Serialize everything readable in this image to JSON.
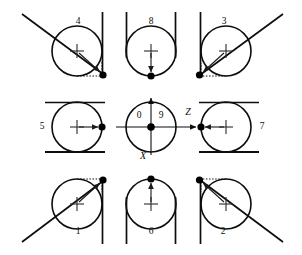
{
  "figure": {
    "type": "technical-diagram",
    "layout": "3x3-grid",
    "background_color": "#ffffff",
    "line_color": "#0d0d0d",
    "dot_color": "#000000"
  },
  "axes": {
    "vertical_label": "X",
    "horizontal_label": "Z",
    "quadrant_left_label": "0",
    "quadrant_right_label": "9",
    "vertical_direction": "up-arrow",
    "horizontal_direction": "right-arrow"
  },
  "cells": [
    {
      "id": "cell-4",
      "label": "4",
      "label_x": 78,
      "label_y": 22,
      "cx": 77,
      "cy": 51,
      "r": 25,
      "contact_dot_x": 104,
      "contact_dot_y": 74,
      "tangents": "diagonal-upper-left + vertical-right",
      "arrow": "center-to-lower-right"
    },
    {
      "id": "cell-8",
      "label": "8",
      "label_x": 151,
      "label_y": 22,
      "cx": 151,
      "cy": 51,
      "r": 25,
      "contact_dot_x": 151,
      "contact_dot_y": 76,
      "tangents": "vertical-left + vertical-right",
      "arrow": "center-down"
    },
    {
      "id": "cell-3",
      "label": "3",
      "label_x": 224,
      "label_y": 22,
      "cx": 226,
      "cy": 51,
      "r": 25,
      "contact_dot_x": 199,
      "contact_dot_y": 75,
      "tangents": "vertical-left + diagonal-upper-right",
      "arrow": "center-to-lower-left"
    },
    {
      "id": "cell-5",
      "label": "5",
      "label_x": 42,
      "label_y": 127,
      "cx": 77,
      "cy": 127,
      "r": 25,
      "contact_dot_x": 102,
      "contact_dot_y": 127,
      "tangents": "horizontal-top + horizontal-bottom",
      "arrow": "center-right"
    },
    {
      "id": "cell-center",
      "label": "",
      "label_x": 151,
      "label_y": 127,
      "cx": 151,
      "cy": 127,
      "r": 25,
      "contact_dot_x": 151,
      "contact_dot_y": 127,
      "tangents": "coordinate-axes",
      "arrow": "origin"
    },
    {
      "id": "cell-7",
      "label": "7",
      "label_x": 262,
      "label_y": 127,
      "cx": 226,
      "cy": 127,
      "r": 25,
      "contact_dot_x": 201,
      "contact_dot_y": 127,
      "tangents": "horizontal-top + horizontal-bottom",
      "arrow": "center-left"
    },
    {
      "id": "cell-1",
      "label": "1",
      "label_x": 78,
      "label_y": 232,
      "cx": 77,
      "cy": 204,
      "r": 25,
      "contact_dot_x": 104,
      "contact_dot_y": 180,
      "tangents": "diagonal-lower-left + vertical-right",
      "arrow": "center-to-upper-right"
    },
    {
      "id": "cell-6",
      "label": "6",
      "label_x": 151,
      "label_y": 232,
      "cx": 151,
      "cy": 204,
      "r": 25,
      "contact_dot_x": 151,
      "contact_dot_y": 179,
      "tangents": "vertical-left + vertical-right",
      "arrow": "center-up"
    },
    {
      "id": "cell-2",
      "label": "2",
      "label_x": 223,
      "label_y": 232,
      "cx": 226,
      "cy": 204,
      "r": 25,
      "contact_dot_x": 199,
      "contact_dot_y": 180,
      "tangents": "vertical-left + diagonal-lower-right",
      "arrow": "center-to-upper-left"
    }
  ]
}
